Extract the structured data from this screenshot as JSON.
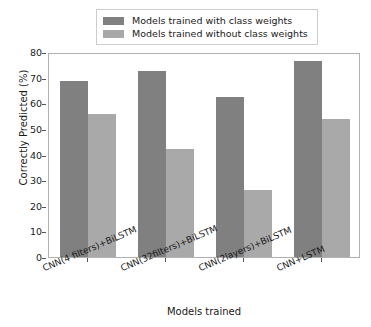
{
  "chart_data": {
    "type": "bar",
    "title": "",
    "xlabel": "Models trained",
    "ylabel": "Correctly Predicted (%)",
    "categories": [
      "CNN(4 filters)+BiLSTM",
      "CNN(32filters)+BiLSTM",
      "CNN(2layers)+BiLSTM",
      "CNN+LSTM"
    ],
    "series": [
      {
        "name": "Models trained with class weights",
        "color": "#808080",
        "values": [
          68.5,
          72.5,
          62.5,
          76.5
        ]
      },
      {
        "name": "Models trained without class weights",
        "color": "#a9a9a9",
        "values": [
          56.0,
          42.0,
          26.0,
          54.0
        ]
      }
    ],
    "ylim": [
      0,
      80
    ],
    "yticks": [
      0,
      10,
      20,
      30,
      40,
      50,
      60,
      70,
      80
    ],
    "ytick_labels": [
      "0",
      "10",
      "20",
      "30",
      "40",
      "50",
      "60",
      "70",
      "80"
    ],
    "grid": false,
    "legend_position": "upper center",
    "xtick_rotation": -23
  },
  "legend": {
    "entries": [
      {
        "label": "Models trained with class weights",
        "color": "#808080"
      },
      {
        "label": "Models trained without class weights",
        "color": "#a9a9a9"
      }
    ]
  },
  "axes": {
    "y_title": "Correctly Predicted (%)",
    "x_title": "Models trained"
  }
}
